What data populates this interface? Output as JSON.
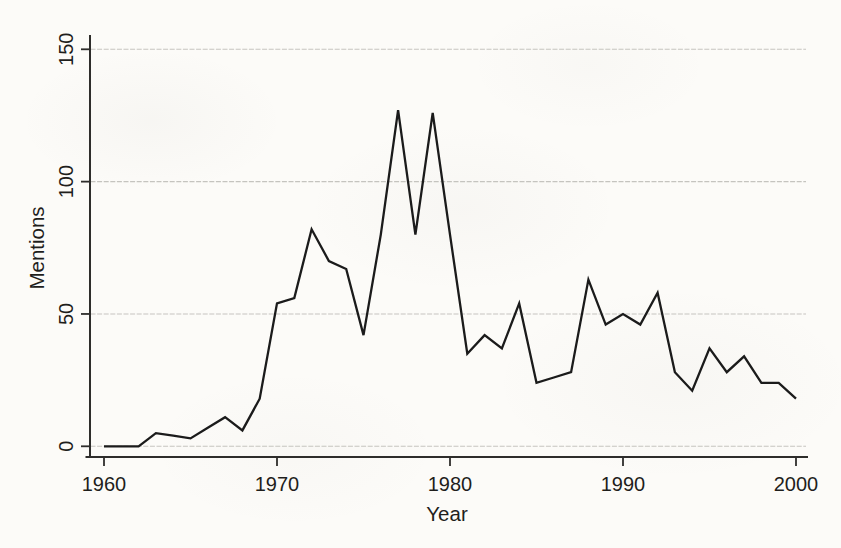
{
  "figure": {
    "background_color": "#fcfbf8"
  },
  "chart_data": {
    "type": "line",
    "title": "",
    "xlabel": "Year",
    "ylabel": "Mentions",
    "x": [
      1960,
      1961,
      1962,
      1963,
      1964,
      1965,
      1966,
      1967,
      1968,
      1969,
      1970,
      1971,
      1972,
      1973,
      1974,
      1975,
      1976,
      1977,
      1978,
      1979,
      1980,
      1981,
      1982,
      1983,
      1984,
      1985,
      1986,
      1987,
      1988,
      1989,
      1990,
      1991,
      1992,
      1993,
      1994,
      1995,
      1996,
      1997,
      1998,
      1999,
      2000
    ],
    "values": [
      0,
      0,
      0,
      5,
      4,
      3,
      7,
      11,
      6,
      18,
      54,
      56,
      82,
      70,
      67,
      42,
      80,
      127,
      80,
      126,
      80,
      35,
      42,
      37,
      54,
      24,
      26,
      28,
      63,
      46,
      50,
      46,
      58,
      28,
      21,
      37,
      28,
      34,
      24,
      24,
      18
    ],
    "xticks": [
      1960,
      1970,
      1980,
      1990,
      2000
    ],
    "yticks": [
      0,
      50,
      100,
      150
    ],
    "xtick_labels": [
      "1960",
      "1970",
      "1980",
      "1990",
      "2000"
    ],
    "ytick_labels": [
      "0",
      "50",
      "100",
      "150"
    ],
    "xlim": [
      1959,
      2001
    ],
    "ylim": [
      0,
      155
    ],
    "grid": "horizontal",
    "legend": "none",
    "line_color": "#1b1b1b",
    "grid_color": "#c3c2bd",
    "axis_color": "#2e2d2b",
    "text_color": "#1f1e1c"
  }
}
